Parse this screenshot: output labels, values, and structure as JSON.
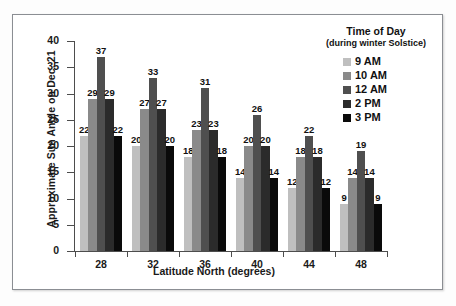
{
  "chart_data": {
    "type": "bar",
    "title": "",
    "xlabel": "Latitude North (degrees)",
    "ylabel": "Approximate Sun Angle on Dec. 21",
    "categories": [
      "28",
      "32",
      "36",
      "40",
      "44",
      "48"
    ],
    "series": [
      {
        "name": "9 AM",
        "color": "#bfbfbf",
        "values": [
          22,
          20,
          18,
          14,
          12,
          9
        ]
      },
      {
        "name": "10 AM",
        "color": "#8a8a8a",
        "values": [
          29,
          27,
          23,
          20,
          18,
          14
        ]
      },
      {
        "name": "12 AM",
        "color": "#4f4f4f",
        "values": [
          37,
          33,
          31,
          26,
          22,
          19
        ]
      },
      {
        "name": "2 PM",
        "color": "#2b2b2b",
        "values": [
          29,
          27,
          23,
          20,
          18,
          14
        ]
      },
      {
        "name": "3 PM",
        "color": "#0a0a0a",
        "values": [
          22,
          20,
          18,
          14,
          12,
          9
        ]
      }
    ],
    "ylim": [
      0,
      40
    ],
    "yticks": [
      "0",
      "5",
      "10",
      "15",
      "20",
      "25",
      "30",
      "35",
      "40"
    ],
    "grid": false,
    "legend_position": "top-right",
    "data_labels": true
  },
  "legend": {
    "title": "Time of Day",
    "subtitle": "(during winter Solstice)",
    "items": [
      {
        "label": "9 AM",
        "color": "#bfbfbf"
      },
      {
        "label": "10 AM",
        "color": "#8a8a8a"
      },
      {
        "label": "12 AM",
        "color": "#4f4f4f"
      },
      {
        "label": "2 PM",
        "color": "#2b2b2b"
      },
      {
        "label": "3 PM",
        "color": "#0a0a0a"
      }
    ]
  },
  "colors": {
    "frame_border": "#8b8e93",
    "axis": "#4d4d4d",
    "text": "#111111",
    "background": "#ffffff"
  }
}
